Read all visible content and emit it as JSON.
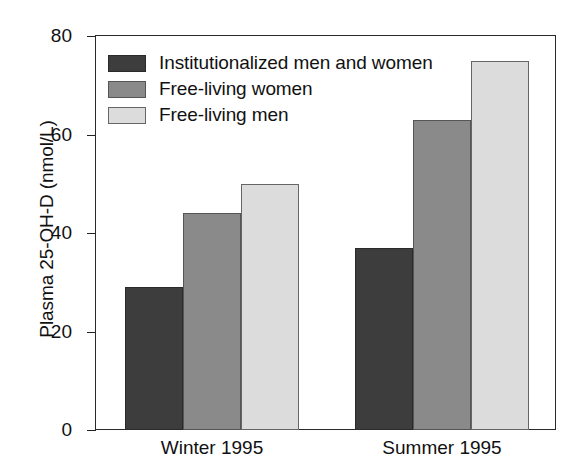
{
  "chart_data": {
    "type": "bar",
    "title": "",
    "xlabel": "",
    "ylabel": "Plasma 25-OH-D (nmol/L)",
    "categories": [
      "Winter 1995",
      "Summer 1995"
    ],
    "series": [
      {
        "name": "Institutionalized men and women",
        "values": [
          29,
          37
        ],
        "color": "#3d3d3d"
      },
      {
        "name": "Free-living women",
        "values": [
          44,
          63
        ],
        "color": "#8a8a8a"
      },
      {
        "name": "Free-living men",
        "values": [
          50,
          75
        ],
        "color": "#dcdcdc"
      }
    ],
    "ylim": [
      0,
      80
    ],
    "yticks": [
      0,
      20,
      40,
      60,
      80
    ],
    "ytick_labels": [
      "0",
      "20",
      "40",
      "60",
      "80"
    ],
    "grid": false,
    "legend_position": "top-left",
    "frame": "box"
  },
  "axes": {
    "y_title": "Plasma 25-OH-D (nmol/L)",
    "y_ticks": [
      {
        "label": "80",
        "value": 80
      },
      {
        "label": "60",
        "value": 60
      },
      {
        "label": "40",
        "value": 40
      },
      {
        "label": "20",
        "value": 20
      },
      {
        "label": "0",
        "value": 0
      }
    ],
    "x_ticks": [
      {
        "label": "Winter 1995"
      },
      {
        "label": "Summer 1995"
      }
    ]
  },
  "legend": {
    "entries": [
      {
        "label": "Institutionalized men and women",
        "swatch": "dark-gray-swatch"
      },
      {
        "label": "Free-living women",
        "swatch": "medium-gray-swatch"
      },
      {
        "label": "Free-living men",
        "swatch": "light-gray-swatch"
      }
    ]
  }
}
